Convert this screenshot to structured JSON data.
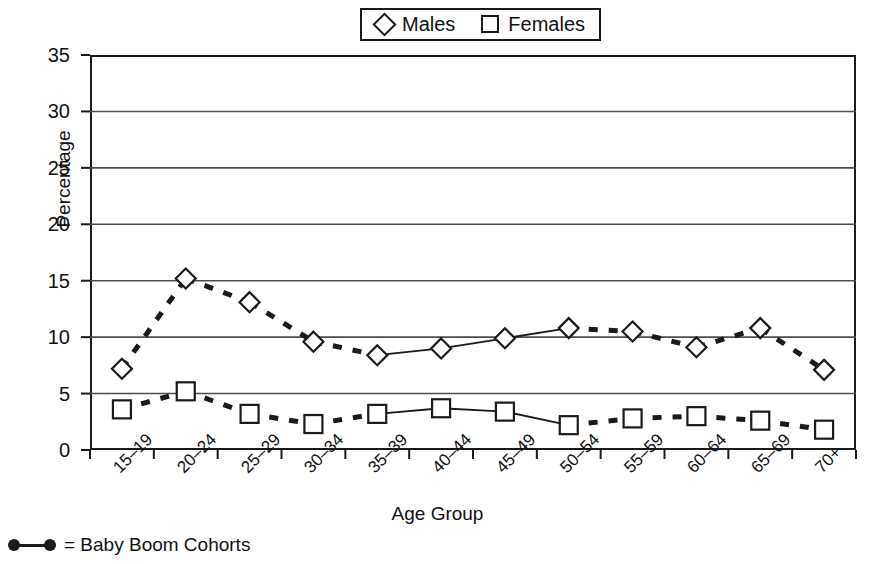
{
  "chart_data": {
    "type": "line",
    "title": "",
    "xlabel": "Age Group",
    "ylabel": "Percentage",
    "ylim": [
      0,
      35
    ],
    "ytick_step": 5,
    "yticks": [
      "0",
      "5",
      "10",
      "15",
      "20",
      "25",
      "30",
      "35"
    ],
    "grid": true,
    "grid_axis": "y",
    "legend_position": "top-center",
    "categories": [
      "15–19",
      "20–24",
      "25–29",
      "30–34",
      "35–39",
      "40–44",
      "45–49",
      "50–54",
      "55–59",
      "60–64",
      "65–69",
      "70+"
    ],
    "series": [
      {
        "name": "Males",
        "marker": "diamond",
        "values": [
          7.2,
          15.2,
          13.1,
          9.6,
          8.4,
          9.0,
          9.9,
          10.8,
          10.5,
          9.1,
          10.8,
          7.1
        ]
      },
      {
        "name": "Females",
        "marker": "square",
        "values": [
          3.6,
          5.2,
          3.2,
          2.3,
          3.2,
          3.7,
          3.4,
          2.2,
          2.8,
          3.0,
          2.6,
          1.8
        ]
      }
    ],
    "line_styles": {
      "solid_segments_label": "non baby boom cohorts",
      "dashed_segments_label": "baby boom cohorts",
      "solid_segment_indices": [
        [
          4,
          5
        ],
        [
          5,
          6
        ],
        [
          6,
          7
        ]
      ],
      "dashed_segment_indices": [
        [
          0,
          1
        ],
        [
          1,
          2
        ],
        [
          2,
          3
        ],
        [
          3,
          4
        ],
        [
          7,
          8
        ],
        [
          8,
          9
        ],
        [
          9,
          10
        ],
        [
          10,
          11
        ]
      ]
    },
    "annotations": [
      {
        "symbol": "dot-line-dot",
        "text": "= Baby Boom Cohorts"
      }
    ]
  },
  "legend": {
    "entries": [
      {
        "label": "Males",
        "marker": "diamond"
      },
      {
        "label": "Females",
        "marker": "square"
      }
    ]
  },
  "footnote": {
    "symbol_name": "baby-boom-marker",
    "text": "= Baby Boom Cohorts"
  },
  "colors": {
    "ink": "#1a1a1a",
    "grid": "#4d4d4d",
    "background": "#ffffff"
  }
}
